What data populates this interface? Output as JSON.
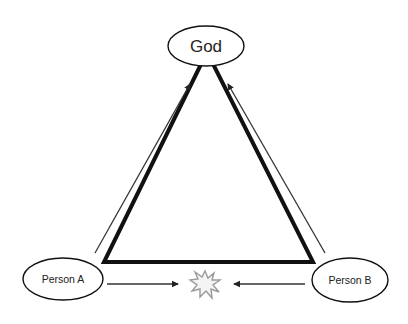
{
  "diagram": {
    "type": "triangle-relationship",
    "nodes": {
      "top": {
        "label": "God"
      },
      "left": {
        "label": "Person A"
      },
      "right": {
        "label": "Person B"
      }
    },
    "edges": [
      {
        "from": "Person A",
        "to": "God",
        "kind": "arrow"
      },
      {
        "from": "Person B",
        "to": "God",
        "kind": "arrow"
      },
      {
        "from": "Person A",
        "to": "conflict",
        "kind": "arrow"
      },
      {
        "from": "Person B",
        "to": "conflict",
        "kind": "arrow"
      }
    ],
    "center_symbol": "conflict-burst-icon",
    "colors": {
      "stroke": "#111111",
      "arrow": "#333333",
      "burst": "#9a9a9a",
      "background": "#ffffff"
    }
  }
}
